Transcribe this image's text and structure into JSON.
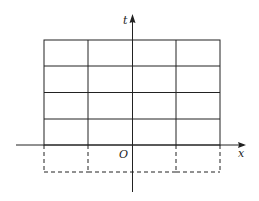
{
  "diagram": {
    "axes": {
      "x_label": "x",
      "y_label": "t",
      "origin_label": "O"
    },
    "grid": {
      "columns": 4,
      "rows": 4,
      "column_lines_x": [
        44,
        88,
        132,
        176,
        220
      ],
      "row_lines_y": [
        40,
        66,
        92,
        119,
        145
      ],
      "dashed_extension_bottom_y": 172
    },
    "colors": {
      "line": "#222222",
      "background": "#ffffff"
    }
  }
}
